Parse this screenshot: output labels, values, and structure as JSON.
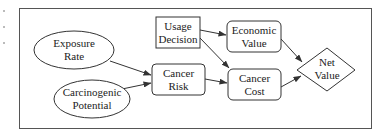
{
  "diagram": {
    "type": "influence-diagram",
    "nodes": [
      {
        "id": "exposure_rate",
        "shape": "ellipse",
        "lines": [
          "Exposure",
          "Rate"
        ]
      },
      {
        "id": "carcinogenic_potential",
        "shape": "ellipse",
        "lines": [
          "Carcinogenic",
          "Potential"
        ]
      },
      {
        "id": "usage_decision",
        "shape": "rectangle",
        "lines": [
          "Usage",
          "Decision"
        ]
      },
      {
        "id": "cancer_risk",
        "shape": "rounded-rectangle",
        "lines": [
          "Cancer",
          "Risk"
        ]
      },
      {
        "id": "economic_value",
        "shape": "rounded-rectangle",
        "lines": [
          "Economic",
          "Value"
        ]
      },
      {
        "id": "cancer_cost",
        "shape": "rounded-rectangle",
        "lines": [
          "Cancer",
          "Cost"
        ]
      },
      {
        "id": "net_value",
        "shape": "diamond",
        "lines": [
          "Net",
          "Value"
        ]
      }
    ],
    "edges": [
      {
        "from": "exposure_rate",
        "to": "cancer_risk"
      },
      {
        "from": "carcinogenic_potential",
        "to": "cancer_risk"
      },
      {
        "from": "usage_decision",
        "to": "economic_value"
      },
      {
        "from": "usage_decision",
        "to": "cancer_cost"
      },
      {
        "from": "cancer_risk",
        "to": "cancer_cost"
      },
      {
        "from": "economic_value",
        "to": "net_value"
      },
      {
        "from": "cancer_cost",
        "to": "net_value"
      }
    ]
  }
}
